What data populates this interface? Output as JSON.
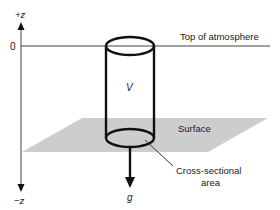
{
  "diagram": {
    "type": "atmospheric column schematic",
    "axis": {
      "top_label": "+z",
      "bottom_label": "−z",
      "zero_label": "0"
    },
    "levels": {
      "top_of_atmosphere": "Top of atmosphere",
      "surface": "Surface"
    },
    "column": {
      "volume_label": "V"
    },
    "gravity": {
      "label": "g"
    },
    "annotations": {
      "cross_section_line1": "Cross-sectional",
      "cross_section_line2": "area"
    },
    "colors": {
      "line": "#111111",
      "thin_line": "#444444",
      "surface_fill": "#cdcdcd",
      "text": "#222222"
    }
  }
}
